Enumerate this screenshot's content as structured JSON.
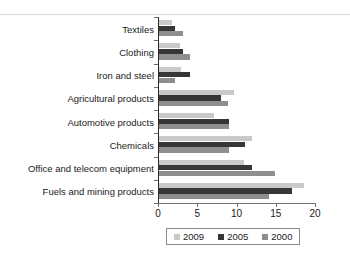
{
  "chart_data": {
    "type": "bar",
    "orientation": "horizontal",
    "title": "",
    "xlabel": "",
    "ylabel": "",
    "xlim": [
      0,
      20
    ],
    "xticks": [
      0,
      5,
      10,
      15,
      20
    ],
    "xtick_labels": [
      "0",
      "5",
      "10",
      "15",
      "20"
    ],
    "grid": false,
    "legend_position": "bottom",
    "categories": [
      "Textiles",
      "Clothing",
      "Iron and steel",
      "Agricultural products",
      "Automotive products",
      "Chemicals",
      "Office and telecom equipment",
      "Fuels and mining products"
    ],
    "series": [
      {
        "name": "2009",
        "color": "#c9c9c9",
        "values": [
          1.7,
          2.7,
          2.8,
          9.5,
          7.0,
          11.8,
          10.8,
          18.5
        ]
      },
      {
        "name": "2005",
        "color": "#363636",
        "values": [
          2.0,
          3.0,
          3.9,
          7.9,
          8.9,
          11.0,
          11.9,
          16.9
        ]
      },
      {
        "name": "2000",
        "color": "#8e8e8e",
        "values": [
          3.0,
          3.9,
          2.0,
          8.8,
          8.9,
          8.9,
          14.8,
          14.0
        ]
      }
    ],
    "legend": [
      {
        "label": "2009",
        "color": "#c9c9c9"
      },
      {
        "label": "2005",
        "color": "#363636"
      },
      {
        "label": "2000",
        "color": "#8e8e8e"
      }
    ]
  }
}
